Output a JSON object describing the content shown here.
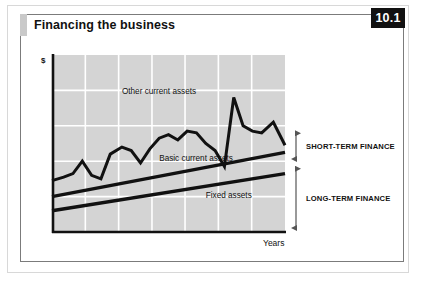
{
  "card": {
    "title": "Financing the business",
    "badge": "10.1"
  },
  "colors": {
    "badge_background": "#111111",
    "badge_text": "#ffffff",
    "card_border": "#7b7b7b",
    "outer_border": "#d8d8d8",
    "title_tab": "#c9c9c9",
    "plot_background": "#d4d4d4",
    "gridline": "#ffffff",
    "axis": "#111111",
    "series_line": "#111111"
  },
  "chart_data": {
    "type": "line",
    "title": "Financing the business",
    "xlabel": "Years",
    "ylabel": "$",
    "grid": true,
    "legend": "inline-annotations",
    "xlim": [
      0,
      100
    ],
    "ylim": [
      0,
      100
    ],
    "x_gridlines": [
      14.3,
      28.6,
      42.9,
      57.1,
      71.4,
      85.7
    ],
    "y_gridlines": [
      20,
      40,
      60,
      80
    ],
    "annotations": [
      {
        "name": "other-current-assets",
        "text": "Other current assets",
        "x": 30,
        "y": 78
      },
      {
        "name": "basic-current-assets",
        "text": "Basic current assets",
        "x": 46,
        "y": 40
      },
      {
        "name": "fixed-assets",
        "text": "Fixed assets",
        "x": 66,
        "y": 19
      }
    ],
    "series": [
      {
        "name": "Other current assets",
        "style": "zigzag",
        "x": [
          0,
          5,
          9,
          13,
          17,
          21,
          25,
          30,
          34,
          38,
          42,
          46,
          50,
          54,
          58,
          62,
          66,
          70,
          74,
          78,
          82,
          86,
          90,
          95,
          100
        ],
        "values": [
          29,
          31,
          33,
          40,
          32,
          30,
          44,
          48,
          46,
          39,
          47,
          53,
          55,
          52,
          57,
          56,
          50,
          46,
          37,
          76,
          60,
          57,
          56,
          62,
          49
        ]
      },
      {
        "name": "Basic current assets",
        "style": "straight",
        "x": [
          0,
          100
        ],
        "values": [
          20,
          45
        ]
      },
      {
        "name": "Fixed assets",
        "style": "straight",
        "x": [
          0,
          100
        ],
        "values": [
          12,
          33
        ]
      }
    ],
    "brackets": [
      {
        "name": "short-term-finance",
        "label": "SHORT-TERM FINANCE",
        "from_y": 39,
        "to_y": 58
      },
      {
        "name": "long-term-finance",
        "label": "LONG-TERM FINANCE",
        "from_y": 0,
        "to_y": 38
      }
    ]
  }
}
